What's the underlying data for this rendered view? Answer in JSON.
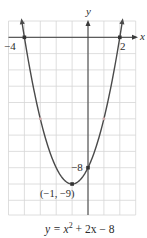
{
  "chart_data": {
    "type": "line",
    "title": "",
    "equation": "y = x² + 2x − 8",
    "equation_parts": {
      "lhs": "y = x",
      "exp": "2",
      "rhs": " + 2x − 8"
    },
    "xlabel": "x",
    "ylabel": "y",
    "xlim": [
      -5,
      3
    ],
    "ylim": [
      -10.9,
      1
    ],
    "grid": true,
    "grid_step": 1,
    "series": [
      {
        "name": "y = x^2 + 2x - 8",
        "function": "x^2 + 2x - 8",
        "x": [
          -4.16,
          -4,
          -3,
          -2,
          -1,
          0,
          1,
          2,
          2.16
        ],
        "y": [
          1,
          0,
          -5,
          -8,
          -9,
          -8,
          -5,
          0,
          1
        ]
      }
    ],
    "marked_points": [
      {
        "x": -4,
        "y": 0,
        "label": "−4"
      },
      {
        "x": 2,
        "y": 0,
        "label": "2"
      },
      {
        "x": 0,
        "y": -8,
        "label": "−8"
      },
      {
        "x": -1,
        "y": -9,
        "label": "(−1, −9)"
      },
      {
        "x": -3,
        "y": -5,
        "label": ""
      },
      {
        "x": 1,
        "y": -5,
        "label": ""
      }
    ]
  },
  "labels": {
    "x_axis": "x",
    "y_axis": "y",
    "x_intercept_left": "−4",
    "x_intercept_right": "2",
    "y_intercept": "−8",
    "vertex": "(−1, −9)"
  },
  "colors": {
    "grid": "#d6d6d6",
    "axis": "#3a3a3a",
    "curve": "#4a4a4a",
    "point": "#333333",
    "minor_point": "#c9a9a9"
  }
}
